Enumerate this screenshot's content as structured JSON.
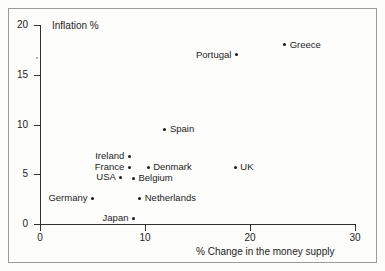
{
  "chart_data": {
    "type": "scatter",
    "title": "",
    "xlabel": "% Change in the money supply",
    "ylabel": "Inflation %",
    "xlim": [
      0,
      30
    ],
    "ylim": [
      0,
      20
    ],
    "xticks": [
      "0",
      "10",
      "20",
      "30"
    ],
    "xtick_values": [
      0,
      10,
      20,
      30
    ],
    "yticks": [
      "0",
      "5",
      "10",
      "15",
      "20"
    ],
    "ytick_values": [
      0,
      5,
      10,
      15,
      20
    ],
    "grid": false,
    "legend": "none",
    "points": [
      {
        "label": "Greece",
        "x": 23.3,
        "y": 18.0,
        "label_side": "right"
      },
      {
        "label": "Portugal",
        "x": 18.7,
        "y": 17.0,
        "label_side": "left"
      },
      {
        "label": "Spain",
        "x": 11.9,
        "y": 9.5,
        "label_side": "right"
      },
      {
        "label": "Ireland",
        "x": 8.5,
        "y": 6.8,
        "label_side": "left"
      },
      {
        "label": "France",
        "x": 8.5,
        "y": 5.7,
        "label_side": "left"
      },
      {
        "label": "Denmark",
        "x": 10.3,
        "y": 5.7,
        "label_side": "right"
      },
      {
        "label": "UK",
        "x": 18.6,
        "y": 5.7,
        "label_side": "right"
      },
      {
        "label": "USA",
        "x": 7.7,
        "y": 4.7,
        "label_side": "left"
      },
      {
        "label": "Belgium",
        "x": 8.9,
        "y": 4.6,
        "label_side": "right"
      },
      {
        "label": "Germany",
        "x": 5.0,
        "y": 2.6,
        "label_side": "left"
      },
      {
        "label": "Netherlands",
        "x": 9.5,
        "y": 2.6,
        "label_side": "right"
      },
      {
        "label": "Japan",
        "x": 8.9,
        "y": 0.6,
        "label_side": "left"
      }
    ]
  }
}
